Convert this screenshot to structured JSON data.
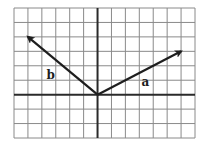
{
  "diagram": {
    "type": "vector-diagram-on-grid",
    "grid": {
      "columns": 13,
      "rows": 9,
      "origin_column": 6,
      "origin_row_from_top": 6,
      "line_color": "#8a8a8a",
      "axis_color": "#2a2a2a"
    },
    "vectors": [
      {
        "label": "a",
        "from": [
          0,
          0
        ],
        "to": [
          6,
          3
        ],
        "color": "#1e1e1e"
      },
      {
        "label": "b",
        "from": [
          0,
          0
        ],
        "to": [
          -5,
          4
        ],
        "color": "#1e1e1e"
      }
    ]
  }
}
